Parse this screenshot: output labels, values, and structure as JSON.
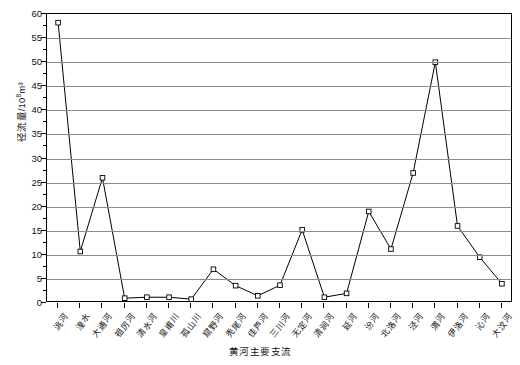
{
  "chart_data": {
    "type": "line",
    "title": "",
    "xlabel": "黄河主要支流",
    "ylabel": "径流量/10⁸m³",
    "ylabel_main": "径流量/10",
    "ylabel_exp": "8",
    "ylabel_unit": "m³",
    "ylim": [
      0,
      60
    ],
    "ytick_step": 5,
    "yticks": [
      0,
      5,
      10,
      15,
      20,
      25,
      30,
      35,
      40,
      45,
      50,
      55,
      60
    ],
    "ytick_labels": [
      "0",
      "5",
      "10",
      "15",
      "20",
      "25",
      "30",
      "35",
      "40",
      "45",
      "50",
      "55",
      "60"
    ],
    "grid": true,
    "grid_axis": "y",
    "legend": false,
    "marker": "open-square",
    "line_color": "#000000",
    "grid_color": "#8a8a8a",
    "categories": [
      "洮河",
      "湟水",
      "大通河",
      "祖厉河",
      "清水河",
      "皇甫川",
      "孤山川",
      "窟野河",
      "秃尾河",
      "佳芦河",
      "三川河",
      "无定河",
      "清涧河",
      "延河",
      "汾河",
      "北洛河",
      "泾河",
      "渭河",
      "伊洛河",
      "沁河",
      "大汶河"
    ],
    "values": [
      58.2,
      10.7,
      26.0,
      1.0,
      1.2,
      1.2,
      0.8,
      7.0,
      3.6,
      1.5,
      3.7,
      15.2,
      1.2,
      2.0,
      19.0,
      11.2,
      27.0,
      50.0,
      16.0,
      9.5,
      4.0
    ]
  }
}
